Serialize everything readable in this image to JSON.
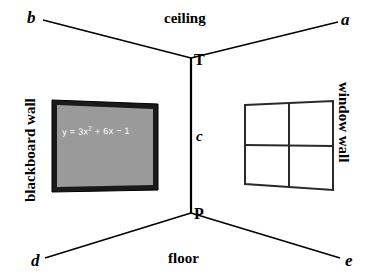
{
  "diagram": {
    "background_color": "#ffffff",
    "line_color": "#000000"
  },
  "vertices": {
    "top_label": "T",
    "bottom_label": "P",
    "top_point": [
      191,
      58
    ],
    "bottom_point": [
      191,
      213
    ]
  },
  "corners": {
    "top_left": "b",
    "top_right": "a",
    "bottom_left": "d",
    "bottom_right": "e"
  },
  "edges": {
    "vertical_label": "c"
  },
  "planes": {
    "ceiling": "ceiling",
    "floor": "floor",
    "left_wall": "blackboard wall",
    "right_wall": "window wall"
  },
  "blackboard": {
    "equation_plain": "y = 3x2 + 6x − 1",
    "equation_lhs": "y = 3x",
    "equation_exp": "2",
    "equation_rhs": " + 6x − 1",
    "frame_color": "#1a1a1a",
    "surface_color": "#9a9a9a",
    "text_color": "#ffffff"
  },
  "window": {
    "panes": 4,
    "frame_color": "#2a2a2a",
    "pane_color": "#ffffff"
  }
}
